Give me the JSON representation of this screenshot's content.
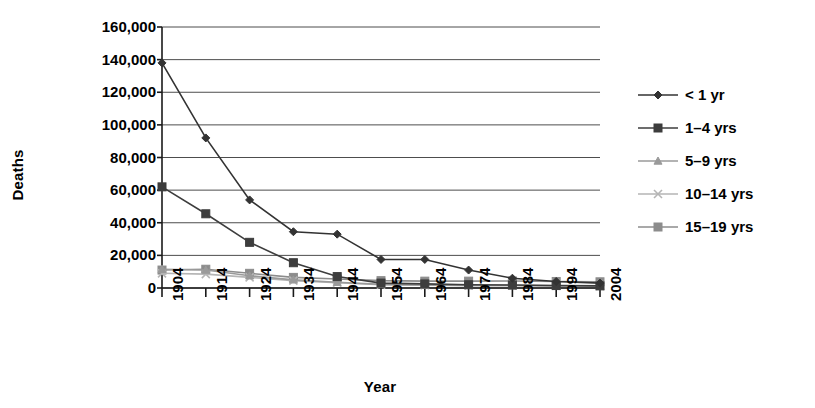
{
  "chart_data": {
    "type": "line",
    "title": "",
    "xlabel": "Year",
    "ylabel": "Deaths",
    "x": [
      1904,
      1914,
      1924,
      1934,
      1944,
      1954,
      1964,
      1974,
      1984,
      1994,
      2004
    ],
    "categories": [
      "1904",
      "1914",
      "1924",
      "1934",
      "1944",
      "1954",
      "1964",
      "1974",
      "1984",
      "1994",
      "2004"
    ],
    "ylim": [
      0,
      160000
    ],
    "yticks": [
      0,
      20000,
      40000,
      60000,
      80000,
      100000,
      120000,
      140000,
      160000
    ],
    "ytick_labels": [
      "0",
      "20,000",
      "40,000",
      "60,000",
      "80,000",
      "100,000",
      "120,000",
      "140,000",
      "160,000"
    ],
    "grid": "horizontal",
    "legend_position": "right",
    "series": [
      {
        "name": "< 1 yr",
        "marker": "diamond",
        "color": "#333333",
        "values": [
          138000,
          92000,
          54000,
          34500,
          33000,
          17500,
          17500,
          11000,
          6000,
          4000,
          3000
        ]
      },
      {
        "name": "1–4 yrs",
        "marker": "square",
        "color": "#3d3d3d",
        "values": [
          62000,
          45500,
          28000,
          15500,
          7000,
          3000,
          2500,
          2000,
          1800,
          1500,
          1300
        ]
      },
      {
        "name": "5–9 yrs",
        "marker": "triangle",
        "color": "#9a9a9a",
        "values": [
          11500,
          11000,
          7500,
          5000,
          3500,
          2200,
          1800,
          1600,
          1500,
          1300,
          1200
        ]
      },
      {
        "name": "10–14 yrs",
        "marker": "x",
        "color": "#b5b5b5",
        "values": [
          9000,
          8500,
          6500,
          4500,
          3200,
          2000,
          1700,
          1600,
          1500,
          1400,
          1300
        ]
      },
      {
        "name": "15–19 yrs",
        "marker": "square",
        "color": "#8c8c8c",
        "values": [
          11000,
          11500,
          9000,
          6500,
          5500,
          4500,
          4200,
          4200,
          4300,
          4000,
          3800
        ]
      }
    ]
  },
  "axes": {
    "y_title": "Deaths",
    "x_title": "Year"
  }
}
